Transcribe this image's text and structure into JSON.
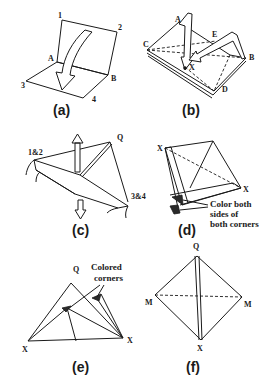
{
  "panels": {
    "a": {
      "caption": "(a)",
      "labels": {
        "p1": "1",
        "p2": "2",
        "p3": "3",
        "p4": "4",
        "A": "A",
        "B": "B"
      }
    },
    "b": {
      "caption": "(b)",
      "labels": {
        "A": "A",
        "C": "C",
        "E": "E",
        "B": "B",
        "D": "D",
        "X": "X"
      }
    },
    "c": {
      "caption": "(c)",
      "labels": {
        "p12": "1&2",
        "Q": "Q",
        "p34": "3&4"
      }
    },
    "d": {
      "caption": "(d)",
      "labels": {
        "X1": "X",
        "X2": "X"
      },
      "note": [
        "Color both",
        "sides of",
        "both corners"
      ]
    },
    "e": {
      "caption": "(e)",
      "labels": {
        "Q": "Q",
        "X1": "X",
        "X2": "X"
      },
      "note": [
        "Colored",
        "corners"
      ]
    },
    "f": {
      "caption": "(f)",
      "labels": {
        "Q": "Q",
        "M1": "M",
        "M2": "M",
        "X": "X"
      }
    }
  }
}
